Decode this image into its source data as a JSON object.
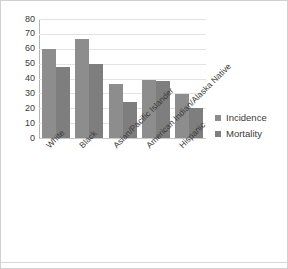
{
  "chart_data": {
    "type": "bar",
    "title": "",
    "subtitle": "",
    "xlabel": "",
    "ylabel": "",
    "categories": [
      "White",
      "Black",
      "Asian/Pacific Islander",
      "American Indian/Alaska Native",
      "Hispanic"
    ],
    "series": [
      {
        "name": "Incidence",
        "values": [
          60,
          66.5,
          36.5,
          39,
          29.5
        ],
        "color": "#8d8d8d"
      },
      {
        "name": "Mortality",
        "values": [
          47.5,
          50,
          24,
          38.5,
          20
        ],
        "color": "#7e7e7e"
      }
    ],
    "ylim": [
      0,
      80
    ],
    "ytick_labels": [
      "80",
      "70",
      "60",
      "50",
      "40",
      "30",
      "20",
      "10",
      "0"
    ],
    "ytick_values": [
      80,
      70,
      60,
      50,
      40,
      30,
      20,
      10,
      0
    ],
    "grid": true,
    "legend_position": "right",
    "annotations": []
  },
  "legend": {
    "items": [
      {
        "label": "Incidence",
        "color": "#8d8d8d"
      },
      {
        "label": "Mortality",
        "color": "#7e7e7e"
      }
    ]
  }
}
